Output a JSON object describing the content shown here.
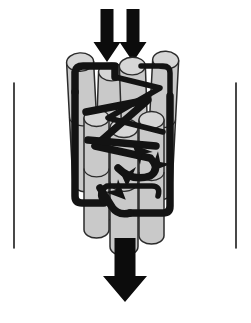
{
  "figure": {
    "title": "Schematic of a transmembrane channel protein within a lipid vesicle",
    "caption": "",
    "background_color": "#ffffff",
    "width": 251,
    "height": 323
  },
  "colors": {
    "background": "#ffffff",
    "outline": "#1a1a1a",
    "helix_fill": "#c9c9c9",
    "helix_cap_fill": "#d6d6d6",
    "helix_stroke": "#2b2b2b",
    "chain": "#131313",
    "flow_arrow": "#0c0c0c"
  },
  "vessel": {
    "name": "cylinder",
    "label": "",
    "top_ellipse": {
      "cx": 125,
      "cy": 83,
      "rx": 111,
      "ry": 57
    },
    "left_wall_x": 14,
    "right_wall_x": 236,
    "wall_top_y": 83,
    "wall_bottom_y": 248,
    "bottom_arc_depth": 57
  },
  "flow_arrows": [
    {
      "name": "inflow-arrow-left",
      "direction": "down",
      "shaft_x": 107,
      "shaft_top_y": 9,
      "shaft_width": 13,
      "head_width": 27,
      "tip_y": 62,
      "head_height": 20
    },
    {
      "name": "inflow-arrow-right",
      "direction": "down",
      "shaft_x": 133,
      "shaft_top_y": 9,
      "shaft_width": 13,
      "head_width": 27,
      "tip_y": 62,
      "head_height": 20
    },
    {
      "name": "outflow-arrow",
      "direction": "down",
      "shaft_x": 125,
      "shaft_top_y": 238,
      "shaft_width": 21,
      "head_width": 44,
      "tip_y": 302,
      "head_height": 26
    }
  ],
  "helices": [
    {
      "name": "helix-a",
      "x": 70,
      "y": 62,
      "w": 27,
      "h": 130,
      "tilt": -3
    },
    {
      "name": "helix-b",
      "x": 96,
      "y": 72,
      "w": 26,
      "h": 148,
      "tilt": 2
    },
    {
      "name": "helix-c",
      "x": 122,
      "y": 66,
      "w": 26,
      "h": 152,
      "tilt": -2
    },
    {
      "name": "helix-d",
      "x": 149,
      "y": 60,
      "w": 26,
      "h": 140,
      "tilt": 3
    },
    {
      "name": "helix-e",
      "x": 84,
      "y": 118,
      "w": 25,
      "h": 120,
      "tilt": 0
    },
    {
      "name": "helix-f",
      "x": 110,
      "y": 128,
      "w": 28,
      "h": 128,
      "tilt": 0
    },
    {
      "name": "helix-g",
      "x": 139,
      "y": 120,
      "w": 25,
      "h": 124,
      "tilt": 0
    }
  ],
  "chain_segments": [
    {
      "name": "chain-top-left-hook",
      "d": "M 75 92 L 75 72 Q 76 66 83 66 L 115 66 L 115 77"
    },
    {
      "name": "chain-top-right-hook",
      "d": "M 141 66 L 163 66 Q 170 66 170 73 L 170 96"
    },
    {
      "name": "chain-left-vertical",
      "d": "M 75 92 L 75 196 Q 75 203 82 203 L 104 203"
    },
    {
      "name": "chain-right-vertical",
      "d": "M 170 96 L 170 206 Q 170 213 163 213 L 130 213"
    },
    {
      "name": "chain-diagonal-major",
      "d": "M 115 77 L 160 88 L 108 118 L 163 132"
    },
    {
      "name": "chain-diagonal-minor",
      "d": "M 86 112 L 148 100 L 95 146 L 150 158"
    },
    {
      "name": "chain-mid-cross",
      "d": "M 88 140 L 156 146"
    },
    {
      "name": "chain-lower-loop",
      "d": "M 104 203 Q 96 192 107 186 L 152 186 Q 161 186 158 196"
    },
    {
      "name": "chain-bottom-curve",
      "d": "M 118 168 Q 132 182 150 176 Q 160 170 152 160"
    },
    {
      "name": "chain-tail",
      "d": "M 130 213 Q 118 216 112 207 L 100 188"
    }
  ],
  "chain_arrowheads": [
    {
      "name": "chain-arrowhead-center",
      "x": 140,
      "y": 152,
      "angle": 225
    },
    {
      "name": "chain-arrowhead-mid",
      "x": 127,
      "y": 176,
      "angle": 90
    },
    {
      "name": "chain-arrowhead-low",
      "x": 118,
      "y": 192,
      "angle": 45
    },
    {
      "name": "chain-arrowhead-right",
      "x": 158,
      "y": 164,
      "angle": 135
    }
  ]
}
